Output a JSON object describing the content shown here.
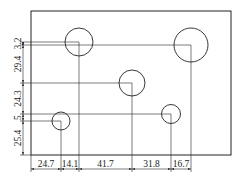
{
  "diagram": {
    "type": "engineering-drawing",
    "colors": {
      "line": "#222222",
      "background": "#ffffff"
    },
    "plate": {
      "x": 31,
      "y": 11,
      "width": 200,
      "height": 144
    },
    "holes": [
      {
        "id": "hole-1",
        "cx": 79,
        "cy": 42,
        "r": 14
      },
      {
        "id": "hole-2",
        "cx": 191,
        "cy": 45,
        "r": 17
      },
      {
        "id": "hole-3",
        "cx": 132,
        "cy": 83,
        "r": 13
      },
      {
        "id": "hole-4",
        "cx": 61,
        "cy": 121,
        "r": 9
      },
      {
        "id": "hole-5",
        "cx": 171,
        "cy": 114,
        "r": 9.5
      }
    ],
    "horizontal_dimensions": [
      {
        "label": "24.7",
        "from": 31,
        "to": 61
      },
      {
        "label": "14.1",
        "from": 61,
        "to": 79
      },
      {
        "label": "41.7",
        "from": 79,
        "to": 132
      },
      {
        "label": "31.8",
        "from": 132,
        "to": 171
      },
      {
        "label": "16.7",
        "from": 171,
        "to": 191
      }
    ],
    "vertical_dimensions": [
      {
        "label": "3.2",
        "from": 42,
        "to": 45
      },
      {
        "label": "29.4",
        "from": 45,
        "to": 83
      },
      {
        "label": "24.3",
        "from": 83,
        "to": 114
      },
      {
        "label": "5",
        "from": 114,
        "to": 121
      },
      {
        "label": "25.4",
        "from": 121,
        "to": 155
      }
    ]
  }
}
